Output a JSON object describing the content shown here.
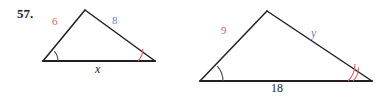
{
  "problem": {
    "number": "57."
  },
  "colors": {
    "stroke": "#231f20",
    "red": "#d4606a",
    "blue": "#6a7fc4",
    "arc_gray": "#4a4a50",
    "background": "#ffffff"
  },
  "figures": [
    {
      "id": "left-triangle",
      "name": "small-triangle",
      "vertices": {
        "left": [
          43,
          61
        ],
        "apex": [
          85,
          10
        ],
        "right": [
          155,
          61
        ]
      },
      "labels": {
        "left_side": "6",
        "right_side": "8",
        "base": "x"
      },
      "angle_marks": {
        "left_vertex": {
          "arcs": 1,
          "color": "gray"
        },
        "right_vertex": {
          "arcs": 1,
          "color": "red"
        }
      }
    },
    {
      "id": "right-triangle",
      "name": "large-triangle",
      "vertices": {
        "left": [
          200,
          81
        ],
        "apex": [
          267,
          11
        ],
        "right": [
          372,
          81
        ]
      },
      "labels": {
        "left_side": "9",
        "right_side": "y",
        "base": "18"
      },
      "angle_marks": {
        "left_vertex": {
          "arcs": 1,
          "color": "gray"
        },
        "right_vertex": {
          "arcs": 2,
          "color": "red"
        }
      }
    }
  ]
}
